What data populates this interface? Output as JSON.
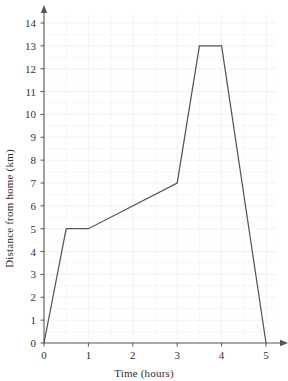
{
  "chart_data": {
    "type": "line",
    "title": "",
    "xlabel": "Time (hours)",
    "ylabel": "Distance from home (km)",
    "xlim": [
      0,
      5
    ],
    "ylim": [
      0,
      14
    ],
    "xticks": [
      "0",
      "1",
      "2",
      "3",
      "4",
      "5"
    ],
    "yticks": [
      "0",
      "1",
      "2",
      "3",
      "4",
      "5",
      "6",
      "7",
      "8",
      "9",
      "10",
      "11",
      "12",
      "13",
      "14"
    ],
    "xtick_values": [
      0,
      1,
      2,
      3,
      4,
      5
    ],
    "ytick_values": [
      0,
      1,
      2,
      3,
      4,
      5,
      6,
      7,
      8,
      9,
      10,
      11,
      12,
      13,
      14
    ],
    "grid": true,
    "minor_grid": true,
    "legend": "none",
    "series": [
      {
        "name": "Distance from home",
        "x": [
          0,
          0.5,
          1,
          3,
          3.5,
          4,
          5
        ],
        "y": [
          0,
          5,
          5,
          7,
          13,
          13,
          0
        ],
        "color": "#555555"
      }
    ],
    "line_color": "#555555",
    "grid_color": "#ededed",
    "axis_color": "#555555",
    "background_color": "#ffffff"
  }
}
